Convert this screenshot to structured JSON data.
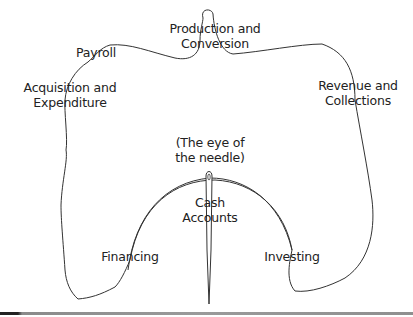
{
  "diagram": {
    "labels": {
      "production": "Production and\nConversion",
      "payroll": "Payroll",
      "acquisition": "Acquisition and\nExpenditure",
      "revenue": "Revenue and\nCollections",
      "eye": "(The eye of\nthe needle)",
      "cash": "Cash\nAccounts",
      "financing": "Financing",
      "investing": "Investing"
    },
    "colors": {
      "line": "#333333",
      "text": "#222222",
      "rule": "#8f8f8f"
    }
  }
}
